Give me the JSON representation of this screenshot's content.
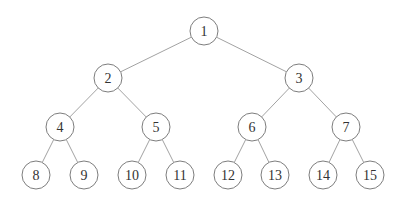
{
  "diagram": {
    "type": "binary-tree",
    "node_radius": 14,
    "colors": {
      "background": "#ffffff",
      "edge": "#8a8a8a",
      "node_stroke": "#6e6e6e",
      "label": "#333333"
    },
    "nodes": [
      {
        "id": 1,
        "label": "1",
        "x": 204,
        "y": 31
      },
      {
        "id": 2,
        "label": "2",
        "x": 108,
        "y": 78
      },
      {
        "id": 3,
        "label": "3",
        "x": 299,
        "y": 78
      },
      {
        "id": 4,
        "label": "4",
        "x": 60,
        "y": 127
      },
      {
        "id": 5,
        "label": "5",
        "x": 156,
        "y": 127
      },
      {
        "id": 6,
        "label": "6",
        "x": 252,
        "y": 127
      },
      {
        "id": 7,
        "label": "7",
        "x": 346,
        "y": 127
      },
      {
        "id": 8,
        "label": "8",
        "x": 36,
        "y": 175
      },
      {
        "id": 9,
        "label": "9",
        "x": 84,
        "y": 175
      },
      {
        "id": 10,
        "label": "10",
        "x": 132,
        "y": 175
      },
      {
        "id": 11,
        "label": "11",
        "x": 180,
        "y": 175
      },
      {
        "id": 12,
        "label": "12",
        "x": 228,
        "y": 175
      },
      {
        "id": 13,
        "label": "13",
        "x": 275,
        "y": 175
      },
      {
        "id": 14,
        "label": "14",
        "x": 323,
        "y": 175
      },
      {
        "id": 15,
        "label": "15",
        "x": 370,
        "y": 175
      }
    ],
    "edges": [
      [
        1,
        2
      ],
      [
        1,
        3
      ],
      [
        2,
        4
      ],
      [
        2,
        5
      ],
      [
        3,
        6
      ],
      [
        3,
        7
      ],
      [
        4,
        8
      ],
      [
        4,
        9
      ],
      [
        5,
        10
      ],
      [
        5,
        11
      ],
      [
        6,
        12
      ],
      [
        6,
        13
      ],
      [
        7,
        14
      ],
      [
        7,
        15
      ]
    ]
  }
}
